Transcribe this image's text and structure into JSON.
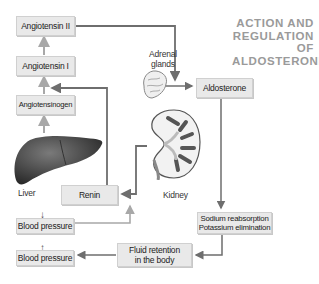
{
  "title": {
    "line1": "ACTION AND",
    "line2": "REGULATION OF",
    "line3": "ALDOSTERONE"
  },
  "nodes": {
    "angiotensin_ii": "Angiotensin II",
    "angiotensin_i": "Angiotensin I",
    "angiotensinogen": "Angiotensinogen",
    "renin": "Renin",
    "aldosterone": "Aldosterone",
    "sodium_line1": "Sodium reabsorption",
    "sodium_line2": "Potassium elimination",
    "fluid_line1": "Fluid retention",
    "fluid_line2": "in the body",
    "bp_low_arrow": "↓",
    "bp_low": "Blood pressure",
    "bp_high_arrow": "↑",
    "bp_high": "Blood pressure"
  },
  "organs": {
    "liver": "Liver",
    "kidney": "Kidney",
    "adrenal_line1": "Adrenal",
    "adrenal_line2": "glands"
  },
  "colors": {
    "box_fill": "#e9e9e9",
    "arrow": "#6e6e6e",
    "title": "#9a9a9a",
    "liver": "#4a4a4a"
  }
}
